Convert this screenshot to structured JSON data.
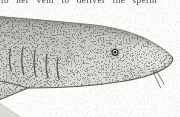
{
  "page": {
    "text_fragment": "to her vent to deliver the sperm"
  },
  "illustration": {
    "subject": "stipple-engraved nurse shark head, side view facing right",
    "elements": [
      "shark-body",
      "top-contour",
      "gill-slits-x5",
      "eye",
      "nasal-barbels",
      "pectoral-fin",
      "far-pectoral-fin-tip",
      "stipple-shading"
    ]
  },
  "colors": {
    "paper": "#fcfcfa",
    "text-ink": "#45443f",
    "body-light": "#dad9d3",
    "body-dark": "#a8a7a1",
    "outline": "#4e4d47",
    "stipple-ink": "#403f39"
  }
}
